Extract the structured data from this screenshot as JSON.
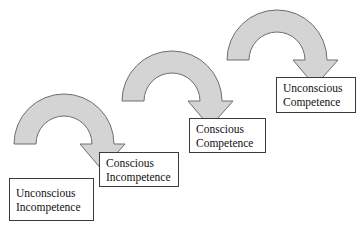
{
  "diagram": {
    "background_color": "#ffffff",
    "arrow_fill_color": "#d4d4d4",
    "arrow_stroke_color": "#6e6e6e",
    "box_border_color": "#3b3b3b",
    "text_color": "#111111",
    "stages": [
      {
        "id": "unconscious-incompetence",
        "line1": "Unconscious",
        "line2": "Incompetence",
        "x": 9,
        "y": 178,
        "width": 85,
        "height": 43
      },
      {
        "id": "conscious-incompetence",
        "line1": "Conscious",
        "line2": "Incompetence",
        "x": 99,
        "y": 152,
        "width": 80,
        "height": 35
      },
      {
        "id": "conscious-competence",
        "line1": "Conscious",
        "line2": "Competence",
        "x": 189,
        "y": 118,
        "width": 77,
        "height": 35
      },
      {
        "id": "unconscious-competence",
        "line1": "Unconscious",
        "line2": "Competence",
        "x": 276,
        "y": 77,
        "width": 80,
        "height": 36
      }
    ],
    "arrows": [
      {
        "id": "arrow-stage1-to-stage2",
        "from": "unconscious-incompetence",
        "to": "conscious-incompetence",
        "center_x": 64,
        "center_y": 144,
        "outer_radius": 50,
        "inner_radius": 28,
        "head_tip_x": 120,
        "head_tip_y": 157
      },
      {
        "id": "arrow-stage2-to-stage3",
        "from": "conscious-incompetence",
        "to": "conscious-competence",
        "center_x": 172,
        "center_y": 101,
        "outer_radius": 50,
        "inner_radius": 28,
        "head_tip_x": 228,
        "head_tip_y": 114
      },
      {
        "id": "arrow-stage3-to-stage4",
        "from": "conscious-competence",
        "to": "unconscious-competence",
        "center_x": 277,
        "center_y": 60,
        "outer_radius": 50,
        "inner_radius": 28,
        "head_tip_x": 333,
        "head_tip_y": 73
      }
    ]
  }
}
